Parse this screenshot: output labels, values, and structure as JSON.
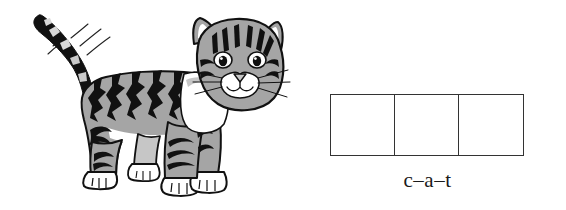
{
  "page": {
    "background_color": "#ffffff",
    "width": 566,
    "height": 210
  },
  "illustration": {
    "name": "cat-illustration",
    "subject": "cat",
    "description": "Black and white line-art clipart of a standing tabby cat facing forward with its tail raised and motion lines",
    "style": "grayscale clipart",
    "colors": {
      "outline": "#111111",
      "fur_gray": "#9e9e9e",
      "fur_light": "#d8d8d8",
      "stripes": "#111111",
      "belly_white": "#ffffff"
    },
    "parts": [
      "tail",
      "motion-lines",
      "body",
      "stripes",
      "head",
      "ears",
      "eyes",
      "nose",
      "whiskers",
      "front-legs",
      "hind-legs",
      "paws"
    ]
  },
  "phoneme_boxes": {
    "name": "phoneme-boxes",
    "count": 3,
    "cells": [
      "",
      "",
      ""
    ],
    "border_color": "#333333",
    "fill_color": "#ffffff"
  },
  "word": {
    "label": "c–a–t",
    "segments": [
      "c",
      "a",
      "t"
    ],
    "separator": "–",
    "text_color": "#1a1a1a"
  }
}
